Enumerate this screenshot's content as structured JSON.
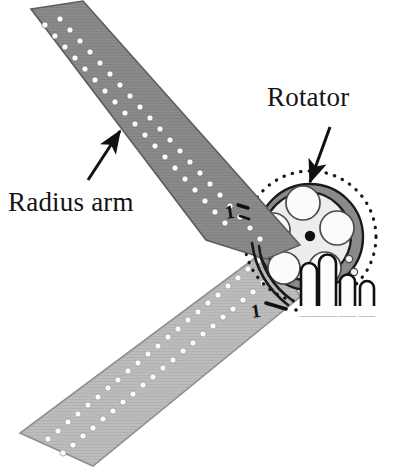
{
  "figure": {
    "background_color": "#ffffff"
  },
  "labels": {
    "rotator": "Rotator",
    "radius_arm": "Radius arm"
  },
  "markers": {
    "upper_digit": "1",
    "lower_digit": "1"
  },
  "colors": {
    "upper_arm_fill": "#878787",
    "lower_arm_fill": "#b9b9b9",
    "rotator_ring_fill": "#8a8a8a",
    "rotator_inner_fill": "#ededed",
    "hole_fill": "#fbfbfb",
    "outline": "#1a1a1a",
    "center_dot": "#111111",
    "prong_fill": "#fdfdfd",
    "text": "#141414"
  },
  "parts": {
    "upper_arm_name": "Radius arm (upper, dark gray)",
    "lower_arm_name": "Radius arm (lower, light gray)",
    "rotator_name": "Rotator disc",
    "rotator_holes_count": 5,
    "prongs_count": 4,
    "dotted_arc_name": "Rotation path dotted arc"
  },
  "annotations": {
    "rotator_leader": "leader line from Rotator label to rotator ring",
    "radius_arm_leader": "leader line from Radius arm label to upper arm"
  }
}
